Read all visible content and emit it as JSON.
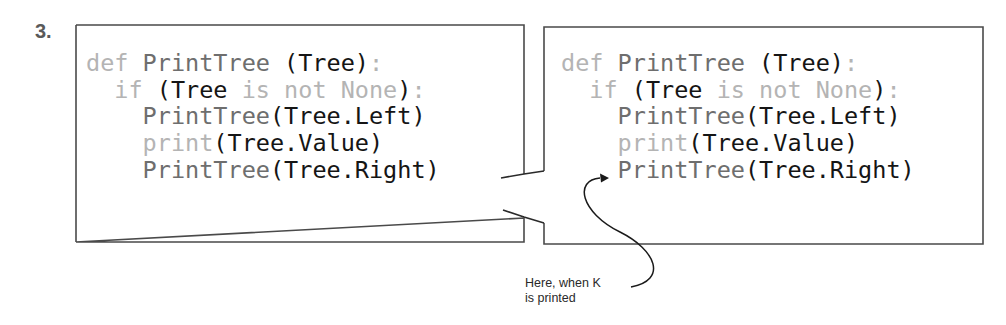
{
  "step": {
    "label": "3."
  },
  "panels": [
    {
      "id": "left",
      "lines": [
        {
          "indent": "",
          "tokens": [
            {
              "t": "def ",
              "c": "kw"
            },
            {
              "t": "PrintTree ",
              "c": "fn"
            },
            {
              "t": "(Tree)",
              "c": "id"
            },
            {
              "t": ":",
              "c": "kw"
            }
          ]
        },
        {
          "indent": "  ",
          "tokens": [
            {
              "t": "if ",
              "c": "kw"
            },
            {
              "t": "(Tree ",
              "c": "id"
            },
            {
              "t": "is not None",
              "c": "kw"
            },
            {
              "t": ")",
              "c": "id"
            },
            {
              "t": ":",
              "c": "kw"
            }
          ]
        },
        {
          "indent": "    ",
          "tokens": [
            {
              "t": "PrintTree",
              "c": "fn"
            },
            {
              "t": "(Tree.Left)",
              "c": "id"
            }
          ]
        },
        {
          "indent": "    ",
          "tokens": [
            {
              "t": "print",
              "c": "kw"
            },
            {
              "t": "(Tree.Value)",
              "c": "id"
            }
          ]
        },
        {
          "indent": "    ",
          "tokens": [
            {
              "t": "PrintTree",
              "c": "fn"
            },
            {
              "t": "(Tree.Right)",
              "c": "id"
            }
          ]
        }
      ]
    },
    {
      "id": "right",
      "lines": [
        {
          "indent": "",
          "tokens": [
            {
              "t": "def ",
              "c": "kw"
            },
            {
              "t": "PrintTree ",
              "c": "fn"
            },
            {
              "t": "(Tree)",
              "c": "id"
            },
            {
              "t": ":",
              "c": "kw"
            }
          ]
        },
        {
          "indent": "  ",
          "tokens": [
            {
              "t": "if ",
              "c": "kw"
            },
            {
              "t": "(Tree ",
              "c": "id"
            },
            {
              "t": "is not None",
              "c": "kw"
            },
            {
              "t": ")",
              "c": "id"
            },
            {
              "t": ":",
              "c": "kw"
            }
          ]
        },
        {
          "indent": "    ",
          "tokens": [
            {
              "t": "PrintTree",
              "c": "fn"
            },
            {
              "t": "(Tree.Left)",
              "c": "id"
            }
          ]
        },
        {
          "indent": "    ",
          "tokens": [
            {
              "t": "print",
              "c": "kw"
            },
            {
              "t": "(Tree.Value)",
              "c": "id"
            }
          ]
        },
        {
          "indent": "    ",
          "tokens": [
            {
              "t": "PrintTree",
              "c": "fn"
            },
            {
              "t": "(Tree.Right)",
              "c": "id"
            }
          ]
        }
      ]
    }
  ],
  "annotation": {
    "line1": "Here, when K",
    "line2": "is printed",
    "points_to_line": 5
  },
  "colors": {
    "border": "#4a4a4a",
    "keyword": "#b4b4b4",
    "function": "#6e6e6e",
    "identifier": "#151515"
  }
}
